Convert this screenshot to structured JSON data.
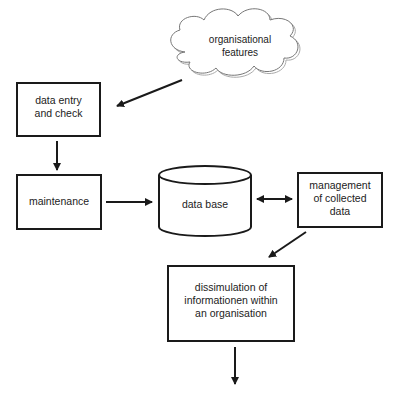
{
  "diagram": {
    "type": "flowchart",
    "nodes": {
      "cloud": {
        "label": "organisational\nfeatures",
        "shape": "cloud"
      },
      "entry": {
        "label": "data entry\nand check",
        "shape": "rectangle"
      },
      "maintenance": {
        "label": "maintenance",
        "shape": "rectangle"
      },
      "database": {
        "label": "data base",
        "shape": "cylinder"
      },
      "management": {
        "label": "management\nof collected\ndata",
        "shape": "rectangle"
      },
      "dissimulation": {
        "label": "dissimulation of\ninformationen within\nan organisation",
        "shape": "rectangle"
      }
    },
    "edges": [
      {
        "from": "organisational features",
        "to": "data entry and check",
        "direction": "forward"
      },
      {
        "from": "data entry and check",
        "to": "maintenance",
        "direction": "forward"
      },
      {
        "from": "maintenance",
        "to": "data base",
        "direction": "forward"
      },
      {
        "from": "data base",
        "to": "management of collected data",
        "direction": "both"
      },
      {
        "from": "management of collected data",
        "to": "dissimulation of informationen within an organisation",
        "direction": "forward"
      },
      {
        "from": "dissimulation of informationen within an organisation",
        "to": "(output)",
        "direction": "forward"
      }
    ],
    "colors": {
      "stroke": "#1a1a1a",
      "cloud_stroke": "#777777",
      "background": "#ffffff"
    }
  }
}
